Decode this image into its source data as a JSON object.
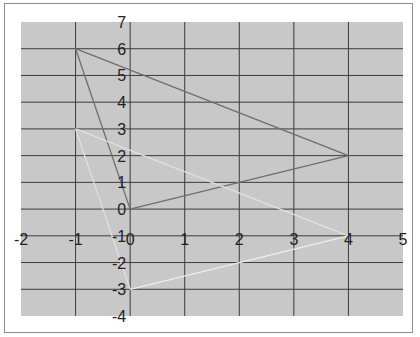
{
  "chart_data": {
    "type": "line",
    "title": "",
    "xlabel": "",
    "ylabel": "",
    "xlim": [
      -2,
      5
    ],
    "ylim": [
      -4,
      7
    ],
    "grid": true,
    "legend": "none",
    "x_ticks": [
      "-2",
      "-1",
      "0",
      "1",
      "2",
      "3",
      "4",
      "5"
    ],
    "y_ticks": [
      "7",
      "6",
      "5",
      "4",
      "3",
      "2",
      "1",
      "0",
      "-1",
      "-2",
      "-3",
      "-4"
    ],
    "colors": {
      "plot_bg": "#c8c8c8",
      "grid": "#3c3c3c",
      "series_dark": "#6e6e6e",
      "series_light": "#e0e0e0",
      "series_white": "#ededed"
    },
    "series": [
      {
        "name": "Triangle A",
        "points": [
          [
            -1,
            6
          ],
          [
            4,
            2
          ],
          [
            0,
            0
          ],
          [
            -1,
            6
          ]
        ]
      },
      {
        "name": "Triangle B",
        "points": [
          [
            -1,
            3
          ],
          [
            4,
            -1
          ],
          [
            0,
            -3
          ],
          [
            -1,
            3
          ]
        ]
      }
    ]
  }
}
